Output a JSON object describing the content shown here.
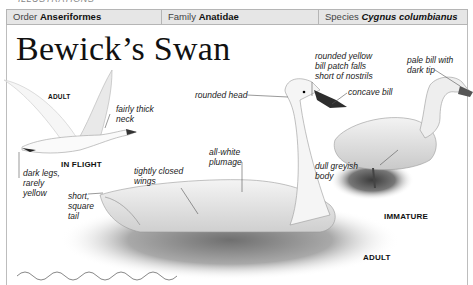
{
  "top_strip": "ILLUSTRATIONS",
  "header": {
    "order": {
      "prefix": "Order",
      "value": "Anseriformes"
    },
    "family": {
      "prefix": "Family",
      "value": "Anatidae"
    },
    "species": {
      "prefix": "Species",
      "value": "Cygnus columbianus"
    }
  },
  "title": "Bewick’s Swan",
  "captions": {
    "flight_adult": "ADULT",
    "in_flight": "IN FLIGHT",
    "immature": "IMMATURE",
    "adult": "ADULT"
  },
  "annotations": {
    "fairly_thick_neck": [
      "fairly thick",
      "neck"
    ],
    "dark_legs": [
      "dark legs,",
      "rarely",
      "yellow"
    ],
    "short_square_tail": [
      "short,",
      "square",
      "tail"
    ],
    "tightly_closed_wings": [
      "tightly closed",
      "wings"
    ],
    "all_white_plumage": [
      "all-white",
      "plumage"
    ],
    "rounded_head": [
      "rounded head"
    ],
    "bill_patch": [
      "rounded yellow",
      "bill patch falls",
      "short of nostrils"
    ],
    "concave_bill": [
      "concave bill"
    ],
    "pale_bill": [
      "pale bill with",
      "dark tip"
    ],
    "dull_greyish_body": [
      "dull greyish",
      "body"
    ]
  },
  "colors": {
    "header_bg": "#e6e6e6",
    "border": "#b5b5b5",
    "bill_dark": "#2a2a2a",
    "water_grey": "#8a8a8a"
  }
}
